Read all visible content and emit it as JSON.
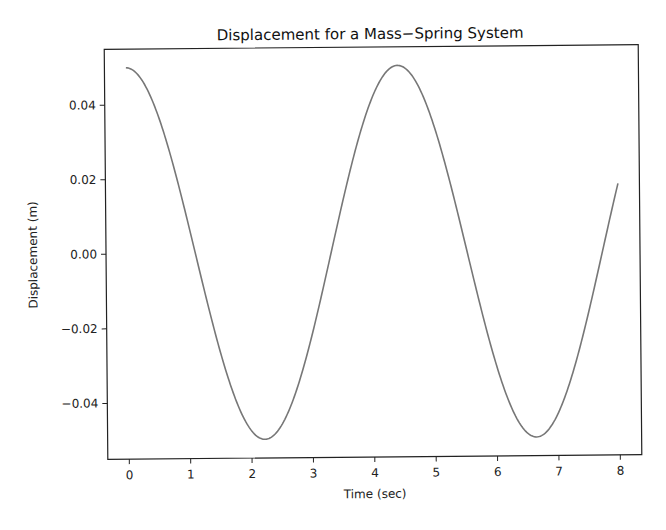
{
  "chart_data": {
    "type": "line",
    "title": "Displacement for a Mass−Spring System",
    "xlabel": "Time (sec)",
    "ylabel": "Displacement (m)",
    "xlim": [
      -0.35,
      8.35
    ],
    "ylim": [
      -0.055,
      0.055
    ],
    "xticks": [
      0,
      1,
      2,
      3,
      4,
      5,
      6,
      7,
      8
    ],
    "xtick_labels": [
      "0",
      "1",
      "2",
      "3",
      "4",
      "5",
      "6",
      "7",
      "8"
    ],
    "yticks": [
      0.04,
      0.02,
      0.0,
      -0.02,
      -0.04
    ],
    "ytick_labels": [
      "0.04",
      "0.02",
      "0.00",
      "−0.02",
      "−0.04"
    ],
    "grid": false,
    "legend": null,
    "series": [
      {
        "name": "displacement",
        "color": "#777777",
        "formula": "0.05*cos(1.42*t)",
        "x": [
          0,
          0.5,
          1,
          1.5,
          2,
          2.2,
          2.5,
          3,
          3.5,
          4,
          4.4,
          4.5,
          5,
          5.5,
          6,
          6.5,
          6.65,
          7,
          7.5,
          8
        ],
        "values": [
          0.05,
          0.0379,
          0.0075,
          -0.0266,
          -0.0478,
          -0.05,
          -0.0464,
          -0.0212,
          0.0135,
          0.0419,
          0.05,
          0.0495,
          0.0356,
          0.0042,
          -0.0294,
          -0.0488,
          -0.05,
          -0.0447,
          -0.0178,
          0.0178
        ]
      }
    ]
  }
}
